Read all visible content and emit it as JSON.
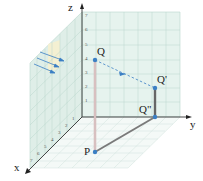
{
  "diagram": {
    "type": "3d-coordinate-projection",
    "axes": {
      "x_label": "x",
      "y_label": "y",
      "z_label": "z",
      "z_ticks": [
        "1",
        "2",
        "3",
        "4",
        "5",
        "6",
        "7"
      ],
      "x_ticks": [
        "1",
        "2",
        "3",
        "4",
        "5",
        "6",
        "7"
      ]
    },
    "points": {
      "Q": "Q",
      "Q_prime": "Q'",
      "Q_double_prime": "Q\"",
      "P": "P"
    },
    "colors": {
      "grid_fill": "#e3f1ec",
      "grid_line": "#b9d6cc",
      "axis": "#333333",
      "point": "#3b7fc4",
      "ray": "#3b7fc4",
      "segment_pq": "#c9a9a9",
      "segment_path": "#7a7a7a",
      "light_patch": "#f7f0cf"
    }
  }
}
